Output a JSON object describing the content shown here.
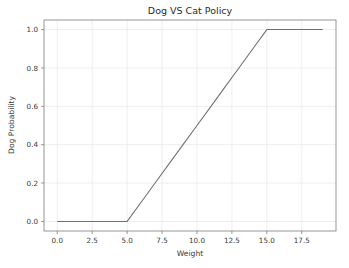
{
  "figure": {
    "background_color": "#ffffff",
    "plot_area_background": "#ffffff"
  },
  "chart_data": {
    "type": "line",
    "title": "Dog VS Cat Policy",
    "xlabel": "Weight",
    "ylabel": "Dog Probability",
    "xlim": [
      -0.95,
      19.95
    ],
    "ylim": [
      -0.05,
      1.05
    ],
    "xticks": [
      0.0,
      2.5,
      5.0,
      7.5,
      10.0,
      12.5,
      15.0,
      17.5
    ],
    "xticklabels": [
      "0.0",
      "2.5",
      "5.0",
      "7.5",
      "10.0",
      "12.5",
      "15.0",
      "17.5"
    ],
    "yticks": [
      0.0,
      0.2,
      0.4,
      0.6,
      0.8,
      1.0
    ],
    "yticklabels": [
      "0.0",
      "0.2",
      "0.4",
      "0.6",
      "0.8",
      "1.0"
    ],
    "grid": true,
    "legend": null,
    "series": [
      {
        "name": "dog probability",
        "color": "#6f6f6f",
        "linewidth": 1.05,
        "x": [
          0.0,
          1.0,
          2.0,
          3.0,
          4.0,
          5.0,
          6.0,
          7.0,
          8.0,
          9.0,
          10.0,
          11.0,
          12.0,
          13.0,
          14.0,
          15.0,
          16.0,
          17.0,
          18.0,
          19.0
        ],
        "y": [
          0.0,
          0.0,
          0.0,
          0.0,
          0.0,
          0.0,
          0.1,
          0.2,
          0.3,
          0.4,
          0.5,
          0.6,
          0.7,
          0.8,
          0.9,
          1.0,
          1.0,
          1.0,
          1.0,
          1.0
        ]
      }
    ],
    "breakpoints": [
      {
        "x": 5.0,
        "y": 0.0,
        "description": "ramp start"
      },
      {
        "x": 15.0,
        "y": 1.0,
        "description": "ramp end / saturation"
      }
    ]
  }
}
